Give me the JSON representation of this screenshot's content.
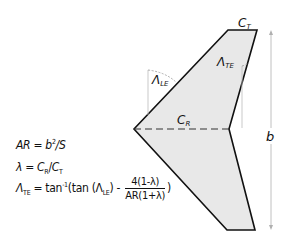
{
  "diagram": {
    "labels": {
      "tip_chord": "C",
      "tip_chord_sub": "T",
      "root_chord": "C",
      "root_chord_sub": "R",
      "span": "b",
      "le_sweep": "Λ",
      "le_sweep_sub": "LE",
      "te_sweep": "Λ",
      "te_sweep_sub": "TE"
    },
    "colors": {
      "fill": "#e8e8e8",
      "outline": "#111111",
      "dimension": "#b0b0b0"
    }
  },
  "equations": {
    "aspect_ratio": {
      "lhs": "AR",
      "rhs_b": "b",
      "rhs_exp": "2",
      "rhs_tail": "/S"
    },
    "taper": {
      "lhs": "λ",
      "rhs": "C",
      "sub1": "R",
      "slash": "/",
      "rhs2": "C",
      "sub2": "T"
    },
    "te_sweep": {
      "lhs": "Λ",
      "lhs_sub": "TE",
      "eq": "= tan",
      "exp": "-1",
      "open": "(tan (Λ",
      "inner_sub": "LE",
      "close_minus": ") -",
      "num": "4(1-λ)",
      "den": "AR(1+λ)",
      "tail": ")"
    }
  }
}
